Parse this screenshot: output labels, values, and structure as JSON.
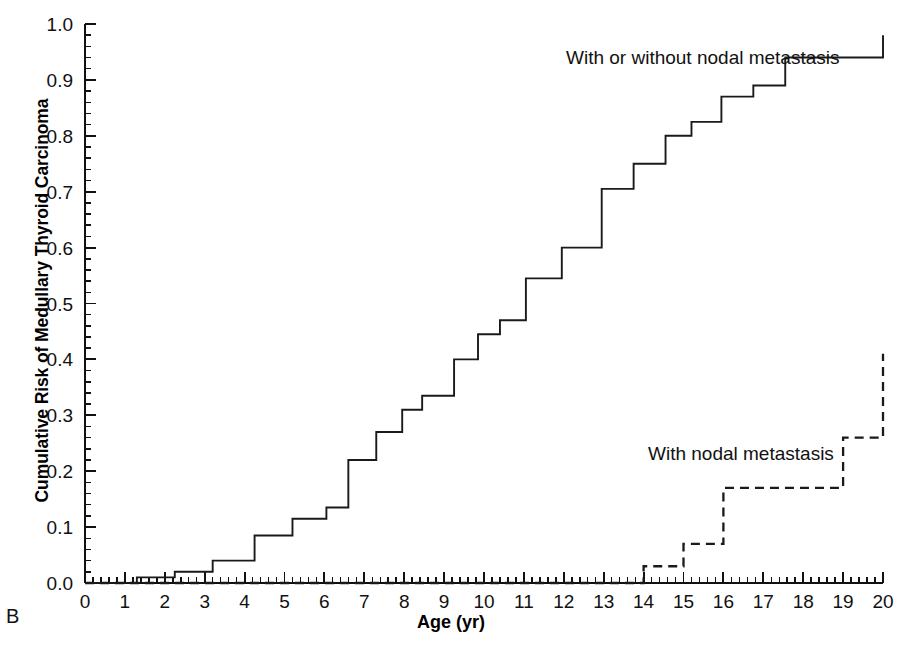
{
  "figure": {
    "panel_label": "B",
    "xlabel": "Age (yr)",
    "ylabel": "Cumulative Risk of Medullary Thyroid Carcinoma"
  },
  "annotations": {
    "solid": "With or without nodal metastasis",
    "dashed": "With nodal metastasis"
  },
  "chart_data": {
    "type": "line",
    "subtype": "kaplan-meier-step",
    "title": "",
    "xlabel": "Age (yr)",
    "ylabel": "Cumulative Risk of Medullary Thyroid Carcinoma",
    "xlim": [
      0,
      20
    ],
    "ylim": [
      0.0,
      1.0
    ],
    "xticks": [
      0,
      1,
      2,
      3,
      4,
      5,
      6,
      7,
      8,
      9,
      10,
      11,
      12,
      13,
      14,
      15,
      16,
      17,
      18,
      19,
      20
    ],
    "xtick_labels": [
      "0",
      "1",
      "2",
      "3",
      "4",
      "5",
      "6",
      "7",
      "8",
      "9",
      "10",
      "11",
      "12",
      "13",
      "14",
      "15",
      "16",
      "17",
      "18",
      "19",
      "20"
    ],
    "yticks": [
      0.0,
      0.1,
      0.2,
      0.3,
      0.4,
      0.5,
      0.6,
      0.7,
      0.8,
      0.9,
      1.0
    ],
    "ytick_labels": [
      "0.0",
      "0.1",
      "0.2",
      "0.3",
      "0.4",
      "0.5",
      "0.6",
      "0.7",
      "0.8",
      "0.9",
      "1.0"
    ],
    "x_minor_ticks_per_major": 5,
    "grid": false,
    "legend_position": "inline-annotation",
    "colors": {
      "solid_curve": "#1a1a1a",
      "dashed_curve": "#1a1a1a",
      "axis": "#111111",
      "background": "#ffffff"
    },
    "series": [
      {
        "name": "With or without nodal metastasis",
        "style": "solid",
        "steps": [
          [
            0.0,
            0.0
          ],
          [
            1.3,
            0.01
          ],
          [
            2.25,
            0.02
          ],
          [
            3.2,
            0.04
          ],
          [
            4.25,
            0.085
          ],
          [
            5.2,
            0.115
          ],
          [
            6.05,
            0.135
          ],
          [
            6.6,
            0.22
          ],
          [
            7.3,
            0.27
          ],
          [
            7.95,
            0.31
          ],
          [
            8.45,
            0.335
          ],
          [
            9.25,
            0.4
          ],
          [
            9.85,
            0.445
          ],
          [
            10.4,
            0.47
          ],
          [
            11.05,
            0.545
          ],
          [
            11.95,
            0.6
          ],
          [
            12.95,
            0.705
          ],
          [
            13.75,
            0.75
          ],
          [
            14.55,
            0.8
          ],
          [
            15.2,
            0.825
          ],
          [
            15.95,
            0.87
          ],
          [
            16.75,
            0.89
          ],
          [
            17.55,
            0.94
          ],
          [
            20.0,
            0.98
          ]
        ]
      },
      {
        "name": "With nodal metastasis",
        "style": "dashed",
        "steps": [
          [
            0.0,
            0.0
          ],
          [
            14.0,
            0.03
          ],
          [
            15.0,
            0.07
          ],
          [
            16.0,
            0.17
          ],
          [
            19.0,
            0.26
          ],
          [
            20.0,
            0.41
          ]
        ]
      }
    ]
  }
}
